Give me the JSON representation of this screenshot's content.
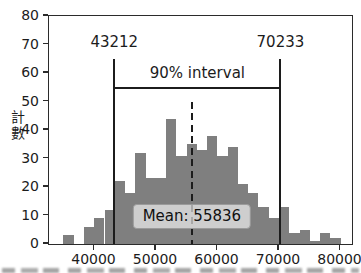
{
  "chart_data": {
    "type": "bar",
    "subtype": "histogram",
    "title": "",
    "xlabel": "",
    "ylabel": "計數",
    "legend": null,
    "grid": false,
    "ylim": [
      0,
      80
    ],
    "xlim": [
      32600,
      81870
    ],
    "x_ticks": [
      40000,
      50000,
      60000,
      70000,
      80000
    ],
    "y_ticks": [
      0,
      10,
      20,
      30,
      40,
      50,
      60,
      70,
      80
    ],
    "bar_color": "#7f7f7f",
    "line_color": "#1c1c1c",
    "bins": {
      "start": 34950,
      "width": 1669,
      "counts": [
        3,
        0,
        6,
        9,
        12,
        22,
        18,
        32,
        23,
        23,
        44,
        31,
        35,
        33,
        38,
        31,
        34,
        21,
        18,
        13,
        9,
        13,
        4,
        5,
        1,
        4,
        2
      ]
    },
    "annotations": {
      "lower_value": 43212,
      "lower_label": "43212",
      "upper_value": 70233,
      "upper_label": "70233",
      "interval_label": "90% interval",
      "mean_value": 55836,
      "mean_label": "Mean: 55836",
      "marker_line_top_count": 65,
      "bracket_count": 55,
      "bound_label_count": 71,
      "interval_label_count": 60,
      "mean_line_top_count": 50,
      "mean_box_top_count": 14
    }
  }
}
